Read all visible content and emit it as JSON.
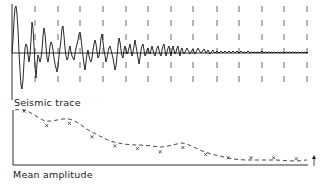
{
  "labels": {
    "top": "Seismic trace",
    "bottom": "Mean amplitude"
  },
  "colors": {
    "ink": "#1a1a1a",
    "dash": "#555555",
    "background": "#ffffff"
  },
  "window_lines_x": [
    35,
    58,
    80,
    103,
    126,
    148,
    171,
    193,
    217,
    239,
    262,
    284,
    307
  ],
  "chart_data": {
    "type": "line",
    "title": "",
    "series": [
      {
        "name": "Mean amplitude",
        "x": [
          1,
          2,
          3,
          4,
          5,
          6,
          7,
          8,
          9,
          10,
          11,
          12,
          13
        ],
        "values": [
          0.95,
          0.68,
          0.72,
          0.47,
          0.3,
          0.25,
          0.19,
          0.27,
          0.14,
          0.08,
          0.08,
          0.08,
          0.06
        ]
      }
    ],
    "xlabel": "",
    "ylabel": "",
    "legend": [],
    "annotations": [
      "Seismic trace",
      "Mean amplitude",
      "arrow marker at right end of time axis"
    ]
  }
}
